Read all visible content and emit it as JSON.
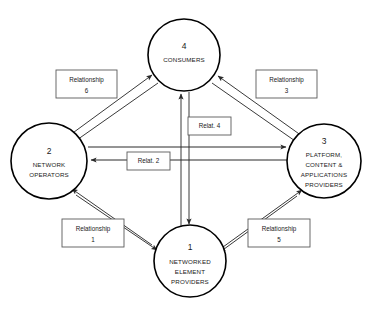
{
  "diagram": {
    "background_color": "#ffffff",
    "line_color": "#3a3a3a",
    "nodes": [
      {
        "id": "node-4",
        "number": "4",
        "lines": [
          "CONSUMERS"
        ],
        "cx": 184,
        "cy": 55,
        "r": 36
      },
      {
        "id": "node-2",
        "number": "2",
        "lines": [
          "NETWORK",
          "OPERATORS"
        ],
        "cx": 49,
        "cy": 161,
        "r": 38
      },
      {
        "id": "node-3",
        "number": "3",
        "lines": [
          "PLATFORM,",
          "CONTENT &",
          "APPLICATIONS",
          "PROVIDERS"
        ],
        "cx": 324,
        "cy": 161,
        "r": 37
      },
      {
        "id": "node-1",
        "number": "1",
        "lines": [
          "NETWORKED",
          "ELEMENT",
          "PROVIDERS"
        ],
        "cx": 190,
        "cy": 261,
        "r": 36
      }
    ],
    "labels": [
      {
        "id": "relationship-6",
        "line1": "Relationship",
        "line2": "6",
        "x": 56,
        "y": 70,
        "w": 61,
        "h": 28
      },
      {
        "id": "relationship-3",
        "line1": "Relationship",
        "line2": "3",
        "x": 256,
        "y": 70,
        "w": 61,
        "h": 28
      },
      {
        "id": "relationship-1",
        "line1": "Relationship",
        "line2": "1",
        "x": 62,
        "y": 219,
        "w": 62,
        "h": 28
      },
      {
        "id": "relationship-5",
        "line1": "Relationship",
        "line2": "5",
        "x": 248,
        "y": 219,
        "w": 62,
        "h": 28
      }
    ],
    "inline_labels": [
      {
        "id": "relat-4",
        "text": "Relat. 4",
        "x": 188,
        "y": 117,
        "w": 43,
        "h": 18
      },
      {
        "id": "relat-2",
        "text": "Relat. 2",
        "x": 127,
        "y": 152,
        "w": 43,
        "h": 18
      }
    ],
    "connections": [
      {
        "id": "conn-2-to-4",
        "from": "node-2",
        "to": "node-4",
        "label": "relationship-6",
        "bidirectional": true
      },
      {
        "id": "conn-4-to-3",
        "from": "node-4",
        "to": "node-3",
        "label": "relationship-3",
        "bidirectional": true
      },
      {
        "id": "conn-2-to-1",
        "from": "node-2",
        "to": "node-1",
        "label": "relationship-1",
        "bidirectional": true
      },
      {
        "id": "conn-1-to-3",
        "from": "node-1",
        "to": "node-3",
        "label": "relationship-5",
        "bidirectional": true
      },
      {
        "id": "conn-4-to-1",
        "from": "node-4",
        "to": "node-1",
        "label": "relat-4",
        "bidirectional": true
      },
      {
        "id": "conn-2-to-3",
        "from": "node-2",
        "to": "node-3",
        "label": "relat-2",
        "bidirectional": true
      }
    ]
  }
}
